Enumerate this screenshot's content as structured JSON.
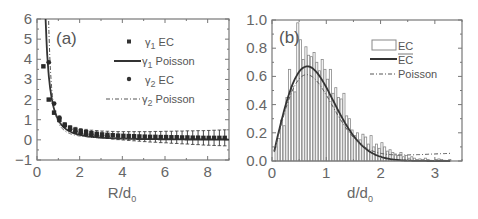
{
  "chart_data": [
    {
      "panel_label": "(a)",
      "type": "scatter",
      "xlabel": "R/d",
      "xlabel_sub": "0",
      "ylabel": "",
      "xlim": [
        0,
        9
      ],
      "ylim": [
        -1,
        6
      ],
      "xticks": [
        "0",
        "2",
        "4",
        "6",
        "8"
      ],
      "yticks": [
        "-1",
        "0",
        "1",
        "2",
        "3",
        "4",
        "5",
        "6"
      ],
      "legend_position": "upper right",
      "grid": false,
      "series": [
        {
          "name": "γ1 EC",
          "style": "square-markers-with-errorbars",
          "x": [
            0.3,
            0.55,
            0.8,
            1.05,
            1.3,
            1.55,
            1.8,
            2.05,
            2.3,
            2.55,
            2.8,
            3.05,
            3.3,
            3.55,
            3.8,
            4.05,
            4.3,
            4.55,
            4.8,
            5.05,
            5.3,
            5.55,
            5.8,
            6.05,
            6.3,
            6.55,
            6.8,
            7.05,
            7.3,
            7.55,
            7.8,
            8.05,
            8.3,
            8.55,
            8.8
          ],
          "y": [
            3.65,
            2.0,
            1.35,
            1.0,
            0.75,
            0.6,
            0.5,
            0.43,
            0.38,
            0.33,
            0.3,
            0.27,
            0.25,
            0.23,
            0.21,
            0.2,
            0.19,
            0.18,
            0.17,
            0.16,
            0.15,
            0.15,
            0.14,
            0.14,
            0.13,
            0.13,
            0.12,
            0.12,
            0.11,
            0.11,
            0.1,
            0.1,
            0.1,
            0.1,
            0.1
          ],
          "err": [
            0.05,
            0.05,
            0.07,
            0.08,
            0.1,
            0.1,
            0.12,
            0.13,
            0.14,
            0.15,
            0.16,
            0.17,
            0.18,
            0.19,
            0.2,
            0.21,
            0.22,
            0.23,
            0.24,
            0.25,
            0.26,
            0.27,
            0.28,
            0.29,
            0.3,
            0.31,
            0.32,
            0.33,
            0.34,
            0.35,
            0.36,
            0.37,
            0.38,
            0.39,
            0.4
          ]
        },
        {
          "name": "γ1 Poisson",
          "style": "solid-line"
        },
        {
          "name": "γ2 EC",
          "style": "circle-markers",
          "x": [
            0.55,
            0.8,
            1.05,
            1.3,
            1.55,
            1.8,
            2.05,
            2.3,
            2.55,
            2.8,
            3.05,
            3.3
          ],
          "y": [
            3.85,
            1.8,
            1.1,
            0.7,
            0.52,
            0.4,
            0.33,
            0.28,
            0.24,
            0.22,
            0.2,
            0.18
          ]
        },
        {
          "name": "γ2 Poisson",
          "style": "dash-dot-line"
        }
      ]
    },
    {
      "panel_label": "(b)",
      "type": "bar",
      "xlabel": "d/d",
      "xlabel_sub": "0",
      "ylabel": "",
      "xlim": [
        0,
        3.5
      ],
      "ylim": [
        0,
        1.0
      ],
      "xticks": [
        "0",
        "1",
        "2",
        "3"
      ],
      "yticks": [
        "0.0",
        "0.2",
        "0.4",
        "0.6",
        "0.8",
        "1.0"
      ],
      "legend_position": "upper right",
      "grid": false,
      "bin_width": 0.05,
      "series": [
        {
          "name": "EC",
          "style": "histogram-open-bars",
          "bin_centers_start": 0.075,
          "values": [
            0.1,
            0.16,
            0.29,
            0.25,
            0.45,
            0.65,
            0.53,
            0.49,
            0.98,
            0.86,
            0.72,
            0.81,
            0.75,
            0.74,
            0.77,
            0.7,
            0.64,
            0.72,
            0.65,
            0.58,
            0.65,
            0.48,
            0.52,
            0.45,
            0.44,
            0.48,
            0.32,
            0.3,
            0.22,
            0.18,
            0.2,
            0.15,
            0.19,
            0.17,
            0.12,
            0.18,
            0.1,
            0.12,
            0.09,
            0.13,
            0.1,
            0.07,
            0.08,
            0.06,
            0.05,
            0.04,
            0.06,
            0.03,
            0.04,
            0.02,
            0.03,
            0.02,
            0.01,
            0.015,
            0.01,
            0.02,
            0.01,
            0.005,
            0.0,
            0.01,
            0.015,
            0.01,
            0.005,
            0.0,
            0.01
          ]
        },
        {
          "name": "EC (mean)",
          "style": "solid-line",
          "x": [
            0.05,
            0.2,
            0.4,
            0.6,
            0.8,
            1.0,
            1.2,
            1.4,
            1.6,
            1.8,
            2.0,
            2.2,
            2.4,
            2.6,
            2.8,
            3.0,
            3.2
          ],
          "y": [
            0.06,
            0.3,
            0.55,
            0.71,
            0.765,
            0.75,
            0.68,
            0.57,
            0.43,
            0.3,
            0.19,
            0.11,
            0.06,
            0.035,
            0.015,
            0.005,
            0.005
          ]
        },
        {
          "name": "Poisson",
          "style": "dash-dot-line"
        }
      ]
    }
  ],
  "panel_a": {
    "label": "(a)",
    "xlabel": "R/d",
    "xlabel_sub": "0",
    "legend": [
      {
        "gamma": "γ",
        "sub": "1",
        "text": " EC"
      },
      {
        "gamma": "γ",
        "sub": "1",
        "text": " Poisson"
      },
      {
        "gamma": "γ",
        "sub": "2",
        "text": " EC"
      },
      {
        "gamma": "γ",
        "sub": "2",
        "text": " Poisson"
      }
    ],
    "xticks": [
      "0",
      "2",
      "4",
      "6",
      "8"
    ],
    "yticks": [
      "−1",
      "0",
      "1",
      "2",
      "3",
      "4",
      "5",
      "6"
    ]
  },
  "panel_b": {
    "label": "(b)",
    "xlabel": "d/d",
    "xlabel_sub": "0",
    "legend": [
      "EC",
      "EC",
      "Poisson"
    ],
    "xticks": [
      "0",
      "1",
      "2",
      "3"
    ],
    "yticks": [
      "0.0",
      "0.2",
      "0.4",
      "0.6",
      "0.8",
      "1.0"
    ]
  }
}
